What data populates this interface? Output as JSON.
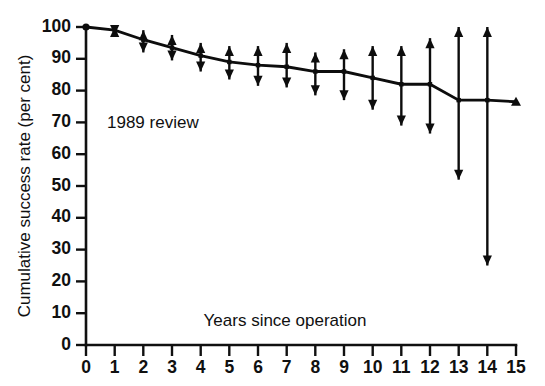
{
  "chart_data": {
    "type": "line",
    "title": "",
    "subtitle": "",
    "xlabel": "Years since operation",
    "ylabel": "Cumulative success rate (per cent)",
    "annotation": "1989 review",
    "xlim": [
      0,
      15
    ],
    "ylim": [
      0,
      100
    ],
    "grid": false,
    "legend": "none",
    "xticks": [
      "0",
      "1",
      "2",
      "3",
      "4",
      "5",
      "6",
      "7",
      "8",
      "9",
      "10",
      "11",
      "12",
      "13",
      "14",
      "15"
    ],
    "yticks": [
      "0",
      "10",
      "20",
      "30",
      "40",
      "50",
      "60",
      "70",
      "80",
      "90",
      "100"
    ],
    "x": [
      0,
      1,
      2,
      3,
      4,
      5,
      6,
      7,
      8,
      9,
      10,
      11,
      12,
      13,
      14,
      15
    ],
    "values": [
      100,
      99,
      96,
      93.5,
      91,
      89,
      88,
      87.5,
      86,
      86,
      84,
      82,
      82,
      77,
      77,
      76.5
    ],
    "error_upper": [
      100,
      100,
      99,
      97.5,
      95,
      94,
      94,
      95,
      92,
      93,
      94,
      94,
      96.5,
      100,
      100,
      76.5
    ],
    "error_lower": [
      100,
      97.5,
      92,
      89.5,
      86,
      83.5,
      81.5,
      81,
      78.5,
      77,
      74,
      69,
      66.5,
      52,
      25,
      76.5
    ],
    "series": [
      {
        "name": "1989 review",
        "values": [
          100,
          99,
          96,
          93.5,
          91,
          89,
          88,
          87.5,
          86,
          86,
          84,
          82,
          82,
          77,
          77,
          76.5
        ]
      }
    ],
    "marker": "arrowhead-capped-error-bars",
    "line_color": "#0d0d0d",
    "background_color": "#ffffff"
  }
}
